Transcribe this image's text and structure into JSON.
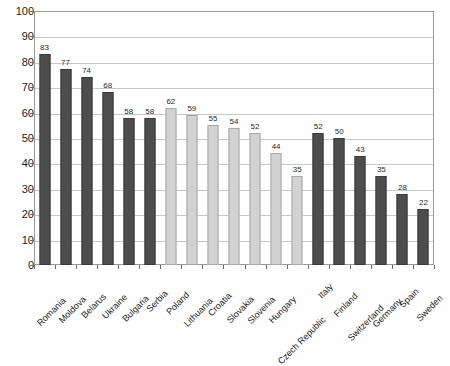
{
  "chart_data": {
    "type": "bar",
    "title": "",
    "xlabel": "",
    "ylabel": "",
    "ylim": [
      0,
      100
    ],
    "ytick_step": 10,
    "yticks": [
      0,
      10,
      20,
      30,
      40,
      50,
      60,
      70,
      80,
      90,
      100
    ],
    "grid": true,
    "legend": "none",
    "categories": [
      "Romania",
      "Moldova",
      "Belarus",
      "Ukraine",
      "Bulgaria",
      "Serbia",
      "Poland",
      "Lithuania",
      "Croatia",
      "Slovakia",
      "Slovenia",
      "Hungary",
      "Czech Republic",
      "Italy",
      "Finland",
      "Switzerland",
      "Germany",
      "Spain",
      "Sweden"
    ],
    "values": [
      83,
      77,
      74,
      68,
      58,
      58,
      62,
      59,
      55,
      54,
      52,
      44,
      35,
      52,
      50,
      43,
      35,
      28,
      22
    ],
    "bar_groups": [
      "dark",
      "dark",
      "dark",
      "dark",
      "dark",
      "dark",
      "light",
      "light",
      "light",
      "light",
      "light",
      "light",
      "light",
      "dark",
      "dark",
      "dark",
      "dark",
      "dark",
      "dark"
    ],
    "data_labels": [
      "83",
      "77",
      "74",
      "68",
      "58",
      "58",
      "62",
      "59",
      "55",
      "54",
      "52",
      "44",
      "35",
      "52",
      "50",
      "43",
      "35",
      "28",
      "22"
    ],
    "ytick_labels": [
      "0",
      "10",
      "20",
      "30",
      "40",
      "50",
      "60",
      "70",
      "80",
      "90",
      "100"
    ]
  },
  "colors": {
    "bar_dark": "#4d4d4d",
    "bar_light": "#d2d2d2",
    "gridline": "#c8c8c8",
    "frame": "#9a9a9a",
    "text": "#1a1a1a",
    "background": "#ffffff"
  }
}
